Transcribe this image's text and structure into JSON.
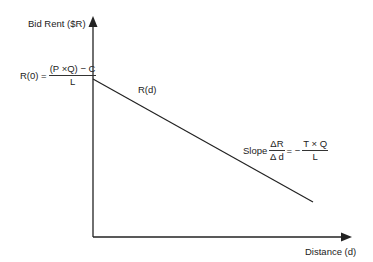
{
  "diagram": {
    "type": "bid-rent-curve",
    "colors": {
      "axis": "#222222",
      "line": "#222222",
      "text": "#222222",
      "background": "#ffffff"
    },
    "y_axis": {
      "label": "Bid Rent ($R)"
    },
    "x_axis": {
      "label": "Distance (d)"
    },
    "curve": {
      "label": "R(d)",
      "start": {
        "x": 93,
        "y": 79
      },
      "end": {
        "x": 313,
        "y": 202
      }
    },
    "intercept": {
      "lhs": "R(0) =",
      "numerator": "(P ×Q) − C",
      "denominator": "L"
    },
    "slope": {
      "prefix": "Slope",
      "lhs_numerator": "ΔR",
      "lhs_denominator": "Δ d",
      "equals": "= −",
      "rhs_numerator": "T × Q",
      "rhs_denominator": "L"
    }
  }
}
